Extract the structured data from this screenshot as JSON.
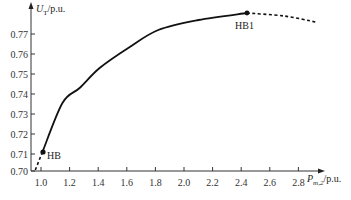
{
  "chart_data": {
    "type": "line",
    "title": "",
    "xlabel": "P_m,2 / p.u.",
    "ylabel": "U_T / p.u.",
    "xlim": [
      0.93,
      3.1
    ],
    "ylim": [
      0.7,
      0.785
    ],
    "grid": false,
    "legend": null,
    "x_ticks": [
      "1.0",
      "1.2",
      "1.4",
      "1.6",
      "1.8",
      "2.0",
      "2.2",
      "2.4",
      "2.6",
      "2.8"
    ],
    "y_ticks": [
      "0.70",
      "0.71",
      "0.72",
      "0.73",
      "0.74",
      "0.75",
      "0.76",
      "0.77"
    ],
    "series": [
      {
        "name": "stable branch (solid)",
        "style": "solid",
        "x": [
          1.01,
          1.15,
          1.27,
          1.41,
          1.61,
          1.82,
          2.1,
          2.44
        ],
        "y": [
          0.711,
          0.7355,
          0.743,
          0.753,
          0.763,
          0.772,
          0.777,
          0.7805
        ]
      },
      {
        "name": "unstable branch below HB (dashed)",
        "style": "dashed",
        "x": [
          0.96,
          1.01
        ],
        "y": [
          0.702,
          0.711
        ]
      },
      {
        "name": "unstable branch beyond HB1 (dashed)",
        "style": "dashed",
        "x": [
          2.44,
          2.7,
          2.92
        ],
        "y": [
          0.7805,
          0.779,
          0.776
        ]
      }
    ],
    "annotations": [
      {
        "label": "HB",
        "x": 1.01,
        "y": 0.711
      },
      {
        "label": "HB1",
        "x": 2.44,
        "y": 0.7805
      }
    ]
  },
  "labels": {
    "y_axis_main": "U",
    "y_axis_sub": "T",
    "y_axis_unit": "/p.u.",
    "x_axis_main": "P",
    "x_axis_sub": "m,2",
    "x_axis_unit": "/p.u.",
    "hb": "HB",
    "hb1": "HB1"
  }
}
